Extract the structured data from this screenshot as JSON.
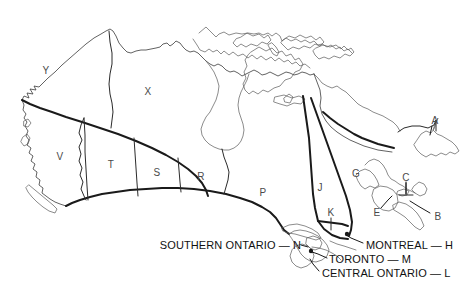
{
  "figure": {
    "background_color": "#ffffff",
    "line_color": "#3a3a3a",
    "heavy_line_color": "#1a1a1a",
    "label_color": "#4a4a4a",
    "callout_color": "#111111",
    "width": 470,
    "height": 286
  },
  "region_labels": [
    {
      "letter": "Y",
      "x": 46,
      "y": 70,
      "name": "region-label-y"
    },
    {
      "letter": "X",
      "x": 148,
      "y": 91,
      "name": "region-label-x"
    },
    {
      "letter": "V",
      "x": 60,
      "y": 156,
      "name": "region-label-v"
    },
    {
      "letter": "T",
      "x": 111,
      "y": 164,
      "name": "region-label-t"
    },
    {
      "letter": "S",
      "x": 157,
      "y": 172,
      "name": "region-label-s"
    },
    {
      "letter": "R",
      "x": 201,
      "y": 176,
      "name": "region-label-r"
    },
    {
      "letter": "P",
      "x": 263,
      "y": 192,
      "name": "region-label-p"
    },
    {
      "letter": "J",
      "x": 320,
      "y": 187,
      "name": "region-label-j"
    },
    {
      "letter": "K",
      "x": 331,
      "y": 212,
      "name": "region-label-k"
    },
    {
      "letter": "G",
      "x": 356,
      "y": 173,
      "name": "region-label-g"
    },
    {
      "letter": "A",
      "x": 435,
      "y": 120,
      "name": "region-label-a"
    },
    {
      "letter": "C",
      "x": 406,
      "y": 177,
      "name": "region-label-c"
    },
    {
      "letter": "E",
      "x": 377,
      "y": 212,
      "name": "region-label-e"
    },
    {
      "letter": "B",
      "x": 438,
      "y": 216,
      "name": "region-label-b"
    }
  ],
  "callouts": [
    {
      "text": "SOUTHERN ONTARIO — N",
      "name": "callout-southern-ontario",
      "x": 299,
      "y": 245,
      "align": "right-of-text"
    },
    {
      "text": "MONTREAL — H",
      "name": "callout-montreal",
      "x": 366,
      "y": 245,
      "align": "left-of-text"
    },
    {
      "text": "TORONTO — M",
      "name": "callout-toronto",
      "x": 329,
      "y": 259,
      "align": "left-of-text"
    },
    {
      "text": "CENTRAL ONTARIO — L",
      "name": "callout-central-ontario",
      "x": 322,
      "y": 273,
      "align": "left-of-text"
    }
  ]
}
